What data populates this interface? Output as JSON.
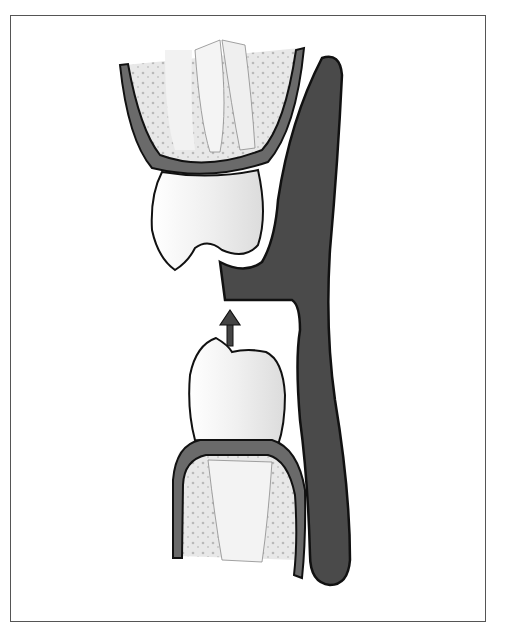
{
  "figure": {
    "type": "dental-illustration",
    "elements": [
      "upper-tooth",
      "upper-gum-bone",
      "appliance",
      "lower-tooth",
      "lower-gum-bone",
      "upward-arrow"
    ],
    "colors": {
      "appliance": "#4a4a4a",
      "gum_band": "#6a6a6a",
      "tooth": "#f2f2f2",
      "bone": "#e3e3e3",
      "outline": "#111111",
      "frame": "#555555"
    }
  }
}
